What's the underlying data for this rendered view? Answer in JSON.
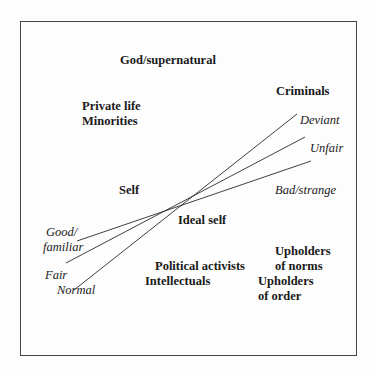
{
  "diagram": {
    "frame": {
      "border_color": "#444444",
      "background": "#fdfdfd"
    },
    "groups": {
      "god": "God/supernatural",
      "private_life": "Private life",
      "minorities": "Minorities",
      "criminals": "Criminals",
      "self": "Self",
      "ideal_self": "Ideal self",
      "political_activists": "Political activists",
      "intellectuals": "Intellectuals",
      "upholders_norms_1": "Upholders",
      "upholders_norms_2": "of norms",
      "upholders_order_1": "Upholders",
      "upholders_order_2": "of order"
    },
    "axes": [
      {
        "negative_pole": "Deviant",
        "positive_pole": "Normal"
      },
      {
        "negative_pole": "Unfair",
        "positive_pole": "Fair"
      },
      {
        "negative_pole": "Bad/strange",
        "positive_pole_line1": "Good/",
        "positive_pole_line2": "familiar"
      }
    ],
    "line_color": "#2a2a2a"
  }
}
